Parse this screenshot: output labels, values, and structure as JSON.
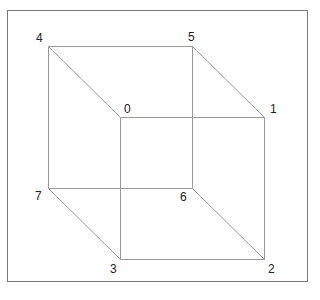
{
  "diagram": {
    "type": "wireframe-cube",
    "edge_color": "#9a9a9a",
    "frame_color": "#7a7a7a",
    "vertices": [
      {
        "id": "0",
        "x": 120,
        "y": 117,
        "label_dx": 4,
        "label_dy": -14
      },
      {
        "id": "1",
        "x": 264,
        "y": 117,
        "label_dx": 6,
        "label_dy": -14
      },
      {
        "id": "2",
        "x": 264,
        "y": 259,
        "label_dx": 4,
        "label_dy": 4
      },
      {
        "id": "3",
        "x": 120,
        "y": 259,
        "label_dx": -10,
        "label_dy": 4
      },
      {
        "id": "4",
        "x": 48,
        "y": 46,
        "label_dx": -12,
        "label_dy": -14
      },
      {
        "id": "5",
        "x": 192,
        "y": 46,
        "label_dx": -4,
        "label_dy": -15
      },
      {
        "id": "6",
        "x": 192,
        "y": 188,
        "label_dx": -12,
        "label_dy": 3
      },
      {
        "id": "7",
        "x": 48,
        "y": 188,
        "label_dx": -13,
        "label_dy": 2
      }
    ],
    "edges": [
      [
        "4",
        "5"
      ],
      [
        "5",
        "1"
      ],
      [
        "1",
        "0"
      ],
      [
        "0",
        "4"
      ],
      [
        "7",
        "6"
      ],
      [
        "6",
        "2"
      ],
      [
        "2",
        "3"
      ],
      [
        "3",
        "7"
      ],
      [
        "4",
        "7"
      ],
      [
        "5",
        "6"
      ],
      [
        "0",
        "3"
      ],
      [
        "1",
        "2"
      ]
    ]
  }
}
